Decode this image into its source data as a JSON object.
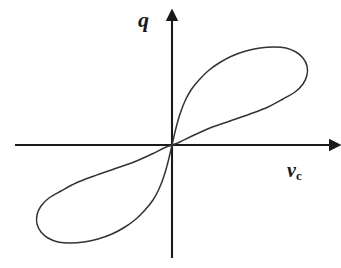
{
  "figure": {
    "kind": "hysteresis-loop-plot",
    "background_color": "#ffffff",
    "curve_color": "#333333",
    "axis_color": "#1a1a1a",
    "y_axis_label": "q",
    "x_axis_label_base": "v",
    "x_axis_label_sub": "c"
  },
  "chart_data": {
    "type": "line",
    "title": "",
    "xlabel": "v_c",
    "ylabel": "q",
    "grid": false,
    "legend": null,
    "annotations": [],
    "axes": {
      "origin_px": [
        172,
        145
      ],
      "x_axis_start_px": [
        15,
        145
      ],
      "x_axis_end_px": [
        336,
        145
      ],
      "y_axis_start_px": [
        172,
        258
      ],
      "y_axis_end_px": [
        172,
        14
      ],
      "arrowheads": [
        "x-positive",
        "y-positive"
      ],
      "tick_labels_x": [],
      "tick_labels_y": []
    },
    "series": [
      {
        "name": "upper-branch",
        "comment": "traced from origin up-left side of loop, over the top, to the right tip and back along the lower-right edge to the origin",
        "points_px": [
          [
            172,
            145
          ],
          [
            176,
            128
          ],
          [
            180,
            114
          ],
          [
            185,
            101
          ],
          [
            191,
            90
          ],
          [
            199,
            80
          ],
          [
            208,
            71
          ],
          [
            219,
            63
          ],
          [
            232,
            56
          ],
          [
            246,
            51
          ],
          [
            260,
            48
          ],
          [
            274,
            47
          ],
          [
            286,
            48
          ],
          [
            296,
            52
          ],
          [
            303,
            58
          ],
          [
            307,
            66
          ],
          [
            307,
            75
          ],
          [
            303,
            84
          ],
          [
            295,
            92
          ],
          [
            283,
            99
          ],
          [
            268,
            107
          ],
          [
            250,
            114
          ],
          [
            230,
            121
          ],
          [
            210,
            128
          ],
          [
            192,
            136
          ],
          [
            180,
            142
          ],
          [
            172,
            145
          ]
        ]
      },
      {
        "name": "lower-branch",
        "comment": "point-symmetric image of the upper branch through the origin",
        "points_px": [
          [
            172,
            145
          ],
          [
            168,
            162
          ],
          [
            164,
            176
          ],
          [
            159,
            189
          ],
          [
            153,
            200
          ],
          [
            145,
            210
          ],
          [
            136,
            219
          ],
          [
            125,
            227
          ],
          [
            112,
            234
          ],
          [
            98,
            239
          ],
          [
            84,
            242
          ],
          [
            70,
            243
          ],
          [
            58,
            242
          ],
          [
            48,
            238
          ],
          [
            41,
            232
          ],
          [
            37,
            224
          ],
          [
            37,
            215
          ],
          [
            41,
            206
          ],
          [
            49,
            198
          ],
          [
            61,
            191
          ],
          [
            76,
            183
          ],
          [
            94,
            176
          ],
          [
            114,
            169
          ],
          [
            134,
            162
          ],
          [
            152,
            154
          ],
          [
            164,
            148
          ],
          [
            172,
            145
          ]
        ]
      }
    ]
  }
}
